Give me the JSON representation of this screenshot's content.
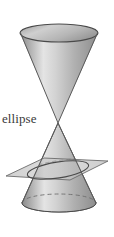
{
  "figure": {
    "label": "ellipse",
    "background_color": "#ffffff",
    "label_color": "#3a3a3a",
    "outline_color": "#4a4a4a",
    "cone_light_color": "#e3e3e3",
    "cone_mid_color": "#b4b4b4",
    "cone_dark_color": "#8e8e8e",
    "plane_color": "#a9a9a9",
    "plane_edge_color": "#6b6b6b",
    "hidden_line_style": "dashed"
  },
  "geometry": {
    "upper_cone": {
      "name": "upper-nappe",
      "apex_x": 58,
      "apex_y": 123,
      "rim_center_x": 59,
      "rim_center_y": 33,
      "rim_radius_x": 39,
      "rim_radius_y": 9
    },
    "lower_cone": {
      "name": "lower-nappe",
      "apex_x": 58,
      "apex_y": 123,
      "base_center_x": 59,
      "base_center_y": 203,
      "base_radius_x": 37,
      "base_radius_y": 9
    },
    "cutting_plane": {
      "name": "cutting-plane",
      "corners": [
        [
          6,
          176
        ],
        [
          44,
          158
        ],
        [
          108,
          161
        ],
        [
          70,
          180
        ]
      ],
      "tilt_degrees": -9
    },
    "ellipse_section": {
      "name": "ellipse-cross-section",
      "center_x": 58,
      "center_y": 170,
      "radius_x": 31,
      "radius_y": 8,
      "rotation_degrees": -9
    }
  }
}
